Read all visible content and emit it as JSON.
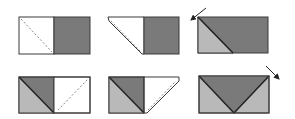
{
  "diagram": {
    "colors": {
      "dark": "#7a7a7a",
      "light": "#b9b9b9",
      "white": "#ffffff",
      "stroke": "#3a3a3a"
    },
    "steps": [
      {
        "id": 1,
        "label": "Step 1: rectangle half white, half dark, dashed diagonal fold line on white half"
      },
      {
        "id": 2,
        "label": "Step 2: top-left corner folded, dashed line along fold"
      },
      {
        "id": 3,
        "label": "Step 3: folded, arrow pointing to top-left corner"
      },
      {
        "id": 4,
        "label": "Step 4: left half with light triangle, dashed diagonal on white right half"
      },
      {
        "id": 5,
        "label": "Step 5: right corner folded"
      },
      {
        "id": 6,
        "label": "Step 6: dark inverted triangle between light triangles, arrow at top-right"
      }
    ]
  }
}
